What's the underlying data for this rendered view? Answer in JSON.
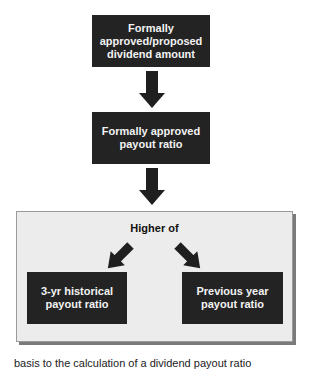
{
  "diagram": {
    "colors": {
      "box_fill": "#232323",
      "box_text": "#f2f2f2",
      "group_fill": "#ececec",
      "group_border": "#9a9a9a",
      "arrow": "#1f1f1f"
    },
    "nodes": [
      {
        "id": "dividend_amount",
        "label": "Formally\napproved/proposed\ndividend amount"
      },
      {
        "id": "payout_ratio",
        "label": "Formally approved\npayout ratio"
      },
      {
        "id": "hist_ratio",
        "label": "3-yr historical\npayout ratio"
      },
      {
        "id": "prev_ratio",
        "label": "Previous year\npayout ratio"
      }
    ],
    "group": {
      "label": "Higher of"
    },
    "edges": [
      {
        "from": "dividend_amount",
        "to": "payout_ratio"
      },
      {
        "from": "payout_ratio",
        "to": "group"
      },
      {
        "from": "group",
        "to": "hist_ratio"
      },
      {
        "from": "group",
        "to": "prev_ratio"
      }
    ],
    "caption": "basis to the calculation of a dividend payout ratio"
  }
}
